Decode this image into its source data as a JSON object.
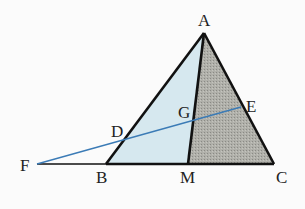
{
  "diagram": {
    "points": {
      "A": {
        "x": 204,
        "y": 33,
        "label": "A",
        "lx": 198,
        "ly": 26
      },
      "B": {
        "x": 106,
        "y": 164,
        "label": "B",
        "lx": 96,
        "ly": 183
      },
      "C": {
        "x": 274,
        "y": 164,
        "label": "C",
        "lx": 276,
        "ly": 183
      },
      "M": {
        "x": 188,
        "y": 164,
        "label": "M",
        "lx": 180,
        "ly": 183
      },
      "D": {
        "x": 124,
        "y": 139,
        "label": "D",
        "lx": 111,
        "ly": 137
      },
      "E": {
        "x": 241,
        "y": 107,
        "label": "E",
        "lx": 246,
        "ly": 112
      },
      "G": {
        "x": 193,
        "y": 119,
        "label": "G",
        "lx": 178,
        "ly": 118
      },
      "F": {
        "x": 37,
        "y": 164,
        "label": "F",
        "lx": 20,
        "ly": 171
      }
    },
    "colors": {
      "light_fill": "#d6e8ef",
      "dark_fill": "#a9a9a3",
      "edge": "#111111",
      "transversal": "#3b7bb6"
    }
  }
}
